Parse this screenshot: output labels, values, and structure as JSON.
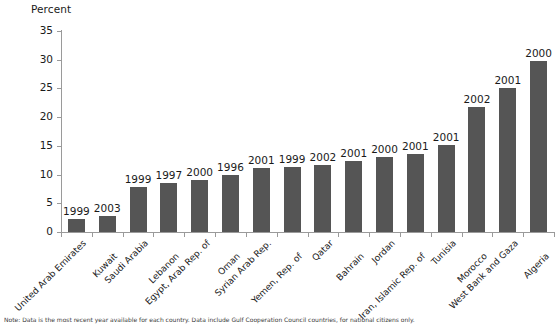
{
  "chart_data": {
    "type": "bar",
    "title": "",
    "xlabel": "",
    "ylabel": "Percent",
    "ylim": [
      0,
      35
    ],
    "yticks": [
      0,
      5,
      10,
      15,
      20,
      25,
      30,
      35
    ],
    "grid": false,
    "legend": "none",
    "bar_color": "#555555",
    "axis_color": "#9a9a9a",
    "categories": [
      "United Arab Emirates",
      "Kuwait",
      "Saudi Arabia",
      "Lebanon",
      "Egypt, Arab Rep. of",
      "Oman",
      "Syrian Arab Rep.",
      "Yemen, Rep. of",
      "Qatar",
      "Bahrain",
      "Jordan",
      "Iran, Islamic Rep. of",
      "Tunisia",
      "Morocco",
      "West Bank and Gaza",
      "Algeria"
    ],
    "values": [
      2.3,
      2.8,
      7.9,
      8.5,
      9.0,
      9.9,
      11.1,
      11.4,
      11.6,
      12.4,
      13.0,
      13.6,
      15.2,
      21.7,
      25.1,
      29.8
    ],
    "point_labels": [
      "1999",
      "2003",
      "1999",
      "1997",
      "2000",
      "1996",
      "2001",
      "1999",
      "2002",
      "2001",
      "2000",
      "2001",
      "2001",
      "2002",
      "2001",
      "2000"
    ]
  },
  "footnote": {
    "text": "Note: Data is the most recent year available for each country. Data include Gulf Cooperation Council countries, for national citizens only."
  }
}
